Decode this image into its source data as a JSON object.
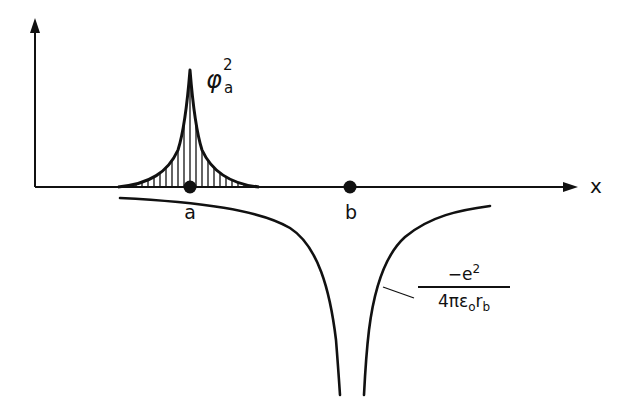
{
  "diagram": {
    "title": "",
    "axes": {
      "x_label": "x",
      "y_label": ""
    },
    "points": [
      {
        "id": "a",
        "label": "a",
        "x": 190,
        "y": 187
      },
      {
        "id": "b",
        "label": "b",
        "x": 350,
        "y": 187
      }
    ],
    "wavefunction": {
      "symbol": "φ",
      "superscript": "2",
      "subscript": "a",
      "description": "Shaded (hatched) peak of the squared wavefunction centered on atom a"
    },
    "potential": {
      "numerator_main": "−e",
      "numerator_sup": "2",
      "denominator_main": "4πε",
      "denominator_sub1": "o",
      "denominator_r": "r",
      "denominator_sub2": "b",
      "description": "Coulomb potential well centered on atom b"
    },
    "colors": {
      "ink": "#111111",
      "background": "#ffffff"
    }
  }
}
